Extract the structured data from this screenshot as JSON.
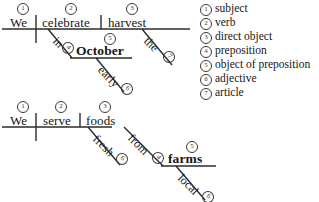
{
  "legend": {
    "items": [
      {
        "num": "1",
        "label": "subject"
      },
      {
        "num": "2",
        "label": "verb"
      },
      {
        "num": "3",
        "label": "direct object"
      },
      {
        "num": "4",
        "label": "preposition"
      },
      {
        "num": "5",
        "label": "object of preposition"
      },
      {
        "num": "6",
        "label": "adjective"
      },
      {
        "num": "7",
        "label": "article"
      }
    ]
  },
  "diagram1": {
    "sentence": "We celebrate the early October harvest",
    "subject": {
      "word": "We",
      "num": "1"
    },
    "verb": {
      "word": "celebrate",
      "num": "2"
    },
    "direct_object": {
      "word": "harvest",
      "num": "3"
    },
    "article": {
      "word": "the",
      "num": "7"
    },
    "preposition": {
      "word": "in",
      "num": "4"
    },
    "object_of_preposition": {
      "word": "October",
      "num": "5"
    },
    "adjective": {
      "word": "early",
      "num": "6"
    }
  },
  "diagram2": {
    "sentence": "We serve fresh foods from local farms",
    "subject": {
      "word": "We",
      "num": "1"
    },
    "verb": {
      "word": "serve",
      "num": "2"
    },
    "direct_object": {
      "word": "foods",
      "num": "3"
    },
    "adjective_obj": {
      "word": "fresh",
      "num": "6"
    },
    "preposition": {
      "word": "from",
      "num": "4"
    },
    "object_of_preposition": {
      "word": "farms",
      "num": "5"
    },
    "adjective_prep": {
      "word": "local",
      "num": "6"
    }
  },
  "colors": {
    "ink": "#161616",
    "rule": "#2b2b2b",
    "circle": "#3a3a3a",
    "background": "#ffffff"
  }
}
